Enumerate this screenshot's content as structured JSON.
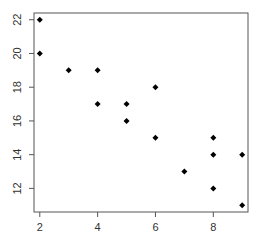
{
  "chart_data": {
    "type": "scatter",
    "title": "",
    "xlabel": "",
    "ylabel": "",
    "xlim": [
      1.8,
      9.2
    ],
    "ylim": [
      10.6,
      22.4
    ],
    "x_ticks": [
      2,
      4,
      6,
      8
    ],
    "y_ticks": [
      12,
      14,
      16,
      18,
      20,
      22
    ],
    "x_tick_labels": [
      "2",
      "4",
      "6",
      "8"
    ],
    "y_tick_labels": [
      "12",
      "14",
      "16",
      "18",
      "20",
      "22"
    ],
    "grid": false,
    "marker": "diamond",
    "color": "#000000",
    "points": [
      {
        "x": 2,
        "y": 22
      },
      {
        "x": 2,
        "y": 20
      },
      {
        "x": 3,
        "y": 19
      },
      {
        "x": 4,
        "y": 19
      },
      {
        "x": 4,
        "y": 17
      },
      {
        "x": 5,
        "y": 17
      },
      {
        "x": 5,
        "y": 16
      },
      {
        "x": 6,
        "y": 18
      },
      {
        "x": 6,
        "y": 15
      },
      {
        "x": 7,
        "y": 13
      },
      {
        "x": 8,
        "y": 15
      },
      {
        "x": 8,
        "y": 14
      },
      {
        "x": 8,
        "y": 12
      },
      {
        "x": 9,
        "y": 14
      },
      {
        "x": 9,
        "y": 11
      }
    ]
  }
}
